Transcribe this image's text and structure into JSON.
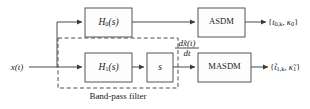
{
  "figure": {
    "type": "block-diagram",
    "background_color": "#ffffff",
    "line_color": "#4a4a4a",
    "text_color": "#1b1b1b"
  },
  "input": {
    "label": "x(t)",
    "label_base": "x",
    "label_arg": "(t)"
  },
  "blocks": [
    {
      "id": "h0",
      "label": "H0(s)",
      "base": "H",
      "subscript": "0",
      "arg": "(s)",
      "x": 85,
      "y": 8,
      "w": 47,
      "h": 29
    },
    {
      "id": "h1",
      "label": "H1(s)",
      "base": "H",
      "subscript": "1",
      "arg": "(s)",
      "x": 85,
      "y": 53,
      "w": 47,
      "h": 29
    },
    {
      "id": "s",
      "label": "s",
      "base": "s",
      "subscript": "",
      "arg": "",
      "x": 147,
      "y": 53,
      "w": 26,
      "h": 29
    },
    {
      "id": "asdm",
      "label": "ASDM",
      "base": "ASDM",
      "subscript": "",
      "arg": "",
      "x": 198,
      "y": 8,
      "w": 47,
      "h": 29
    },
    {
      "id": "masdm",
      "label": "MASDM",
      "base": "MASDM",
      "subscript": "",
      "arg": "",
      "x": 198,
      "y": 53,
      "w": 53,
      "h": 29
    }
  ],
  "dashed_group": {
    "caption": "Band-pass filter",
    "x": 58,
    "y": 38,
    "w": 120,
    "h": 50
  },
  "signals": {
    "derivative": {
      "label": "dx̃(t)/dt",
      "numerator": "dx̃(t)",
      "denominator": "dt"
    }
  },
  "outputs": [
    {
      "id": "asdm-output",
      "label": "{t0,k, κ0}",
      "open": "{",
      "t_symbol": "t",
      "t_subscript": "0,k",
      "kappa_symbol": "κ",
      "kappa_subscript": "0",
      "separator": ", ",
      "close": "}",
      "tilde": false
    },
    {
      "id": "masdm-output",
      "label": "{t̃1,k, κ̃1}",
      "open": "{",
      "t_symbol": "t̃",
      "t_subscript": "1,k",
      "kappa_symbol": "κ̃",
      "kappa_subscript": "1",
      "separator": ", ",
      "close": "}",
      "tilde": true
    }
  ]
}
